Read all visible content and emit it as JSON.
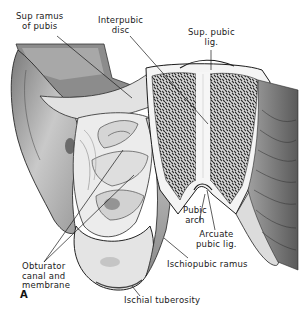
{
  "figure": {
    "panel_letter": "A",
    "labels": {
      "sup_ramus": "Sup ramus\nof pubis",
      "interpubic_disc": "Interpubic\ndisc",
      "sup_pubic_lig": "Sup. pubic\nlig.",
      "pubic_arch": "Pubic\narch",
      "arcuate_pubic_lig": "Arcuate\npubic lig.",
      "obturator": "Obturator\ncanal and\nmembrane",
      "ischiopubic_ramus": "Ischiopubic ramus",
      "ischial_tuberosity": "Ischial tuberosity"
    },
    "colors": {
      "ink": "#1a1a1a",
      "bone_light": "#e6e6e6",
      "bone_mid": "#b8b8b8",
      "bone_dark": "#6e6e6e",
      "cancellous": "#3a3a3a",
      "disc": "#f2f2f2"
    }
  }
}
